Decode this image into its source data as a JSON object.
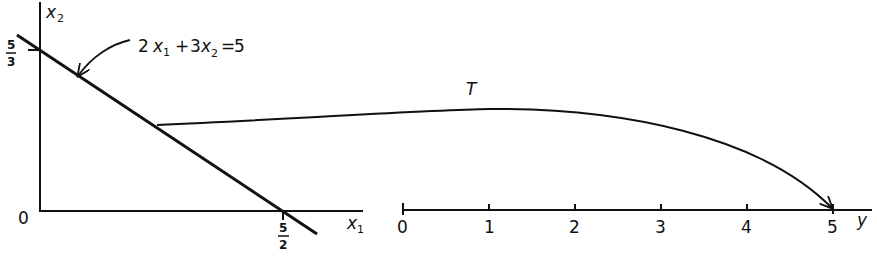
{
  "figure": {
    "left_plot": {
      "x_axis_label": "x",
      "x_axis_subscript": "1",
      "y_axis_label": "x",
      "y_axis_subscript": "2",
      "origin_label": "0",
      "x_intercept": {
        "numerator": "5",
        "denominator": "2"
      },
      "y_intercept": {
        "numerator": "5",
        "denominator": "3"
      },
      "constraint_label": {
        "coef1": "2",
        "var1": "x",
        "var1_sub": "1",
        "plus": "+",
        "coef2": "3",
        "var2": "x",
        "var2_sub": "2",
        "equals": "=",
        "rhs": "5"
      }
    },
    "mapping": {
      "label": "T"
    },
    "right_axis": {
      "axis_label": "y",
      "ticks": [
        "0",
        "1",
        "2",
        "3",
        "4",
        "5"
      ]
    },
    "colors": {
      "ink": "#111111",
      "background": "#ffffff"
    }
  }
}
